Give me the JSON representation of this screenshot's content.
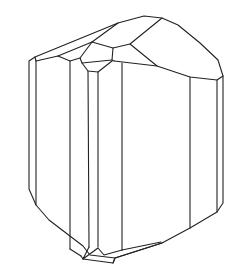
{
  "figure": {
    "stroke_color": "#222222",
    "background": "#ffffff"
  }
}
